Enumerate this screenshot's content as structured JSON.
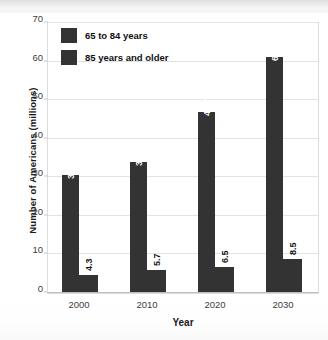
{
  "chart_data": {
    "type": "bar",
    "title": "",
    "xlabel": "Year",
    "ylabel": "Number of Americans (millions)",
    "categories": [
      "2000",
      "2010",
      "2020",
      "2030"
    ],
    "series": [
      {
        "name": "65 to 84 years",
        "values": [
          30.4,
          33.7,
          46.7,
          60.9
        ],
        "color": "#333333"
      },
      {
        "name": "85 years and older",
        "values": [
          4.3,
          5.7,
          6.5,
          8.5
        ],
        "color": "#333333"
      }
    ],
    "ylim": [
      0,
      70
    ],
    "yticks": [
      0,
      10,
      20,
      30,
      40,
      50,
      60,
      70
    ],
    "ytick_labels": [
      "0",
      "10",
      "20",
      "30",
      "40",
      "50",
      "60",
      "70"
    ],
    "grid": "horizontal",
    "legend_position": "upper-left-inside",
    "value_labels_rotated": true,
    "value_label_texts": {
      "series1": [
        "30.4",
        "33.7",
        "46.7",
        "60.9"
      ],
      "series2": [
        "4.3",
        "5.7",
        "6.5",
        "8.5"
      ]
    }
  },
  "legend": {
    "items": [
      {
        "label": "65 to 84 years"
      },
      {
        "label": "85 years and older"
      }
    ]
  },
  "axes": {
    "y_title": "Number of Americans (millions)",
    "x_title": "Year"
  }
}
